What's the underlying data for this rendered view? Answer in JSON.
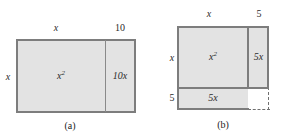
{
  "figure": {
    "colors": {
      "fill": "#e3e3e3",
      "stroke": "#8a8a8a",
      "dashed_stroke": "#6f6f6f",
      "background": "#ffffff",
      "text": "#2b2b2b"
    }
  },
  "panels": [
    {
      "caption": "(a)",
      "top_labels": [
        {
          "text": "x",
          "italic": true
        },
        {
          "text": "10",
          "italic": false
        }
      ],
      "left_labels": [
        {
          "text": "x",
          "italic": true
        }
      ],
      "regions": [
        {
          "label": "x²",
          "base": "x",
          "exp": "2",
          "filled": true
        },
        {
          "label": "10x",
          "base": "10x",
          "exp": "",
          "filled": true
        }
      ]
    },
    {
      "caption": "(b)",
      "top_labels": [
        {
          "text": "x",
          "italic": true
        },
        {
          "text": "5",
          "italic": false
        }
      ],
      "left_labels": [
        {
          "text": "x",
          "italic": true
        },
        {
          "text": "5",
          "italic": false
        }
      ],
      "regions": [
        {
          "label": "x²",
          "base": "x",
          "exp": "2",
          "filled": true
        },
        {
          "label": "5x",
          "base": "5x",
          "exp": "",
          "filled": true
        },
        {
          "label": "5x",
          "base": "5x",
          "exp": "",
          "filled": true
        },
        {
          "label": "",
          "base": "",
          "exp": "",
          "filled": false
        }
      ]
    }
  ],
  "text": {
    "panel_a": {
      "top_x": "x",
      "top_10": "10",
      "left_x": "x",
      "region_x_squared_base": "x",
      "region_x_squared_exp": "2",
      "region_10x": "10x",
      "caption": "(a)"
    },
    "panel_b": {
      "top_x": "x",
      "top_5": "5",
      "left_x": "x",
      "left_5": "5",
      "region_x_squared_base": "x",
      "region_x_squared_exp": "2",
      "region_5x_right": "5x",
      "region_5x_bottom": "5x",
      "caption": "(b)"
    }
  }
}
